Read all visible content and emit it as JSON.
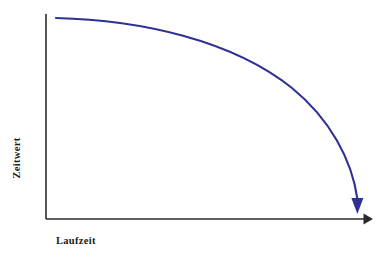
{
  "chart_data": {
    "type": "line",
    "title": "",
    "subtitle": "",
    "xlabel": "Laufzeit",
    "ylabel": "Zeitwert",
    "annotations": [],
    "legend": [],
    "legend_position": "none",
    "grid": false,
    "x_tick_labels": [],
    "y_tick_labels": [],
    "xlim": [
      0,
      100
    ],
    "ylim": [
      0,
      100
    ],
    "axis_color": "#2b2b2b",
    "background_color": "#ffffff",
    "series": [
      {
        "name": "Zeitwert",
        "color": "#2e3192",
        "line_width": 2.1,
        "arrow_end": "down",
        "x": [
          3,
          12,
          24,
          36,
          48,
          60,
          70,
          79,
          86,
          91,
          94,
          95
        ],
        "y": [
          98,
          97,
          94,
          89,
          82,
          72,
          60,
          45,
          30,
          16,
          7,
          2
        ]
      }
    ]
  },
  "axes": {
    "y_axis": {
      "name": "y-axis",
      "x": 46,
      "y_top": 14,
      "y_bottom": 219,
      "has_arrow": false,
      "ticks": []
    },
    "x_axis": {
      "name": "x-axis",
      "y": 219,
      "x_left": 46,
      "x_right": 373,
      "has_arrow": true,
      "arrow_direction": "right",
      "ticks": []
    }
  },
  "curve_geometry": {
    "start_x": 56,
    "start_y": 18,
    "end_x": 358,
    "end_y": 205,
    "arrow_tip_x": 358,
    "arrow_tip_y": 214,
    "path": "M 56 18 C 140 20, 232 40, 292 88 C 330 119, 352 160, 357.4 199",
    "arrow_head_points": "351.4,198 363.4,198 357.4,214"
  },
  "labels": {
    "x_axis_label": "Laufzeit",
    "y_axis_label": "Zeitwert"
  },
  "colors": {
    "curve": "#2e3192",
    "axis": "#2b2b2b",
    "text": "#1c1c1c",
    "background": "#ffffff"
  }
}
